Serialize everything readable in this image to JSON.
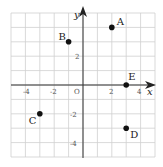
{
  "figure": {
    "type": "coordinate-grid",
    "x_axis_label": "x",
    "y_axis_label": "y",
    "origin_label": "O",
    "x_range": [
      -5,
      5
    ],
    "y_range": [
      -5,
      5
    ],
    "grid_step": 1,
    "x_tick_labels": [
      "-4",
      "-2",
      "2",
      "4"
    ],
    "y_tick_labels": [
      "2",
      "-2",
      "-4"
    ],
    "points": [
      {
        "label": "A",
        "x": 2,
        "y": 4
      },
      {
        "label": "B",
        "x": -1,
        "y": 3
      },
      {
        "label": "C",
        "x": -3,
        "y": -2
      },
      {
        "label": "D",
        "x": 3,
        "y": -3
      },
      {
        "label": "E",
        "x": 3,
        "y": 0
      }
    ],
    "colors": {
      "grid": "#cfcfcf",
      "axis": "#333333",
      "point": "#111111"
    }
  }
}
